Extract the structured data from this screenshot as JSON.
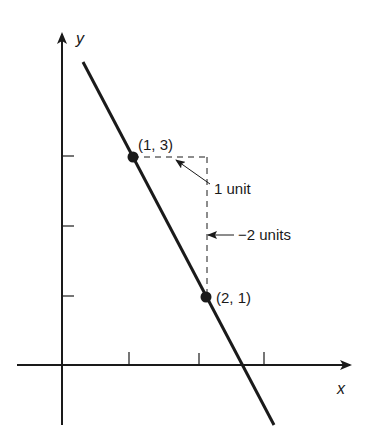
{
  "diagram": {
    "type": "slope-illustration",
    "axes": {
      "x_label": "x",
      "y_label": "y"
    },
    "points": [
      {
        "label": "(1, 3)",
        "x": 1,
        "y": 3
      },
      {
        "label": "(2, 1)",
        "x": 2,
        "y": 1
      }
    ],
    "annotations": {
      "run": "1 unit",
      "rise": "−2 units"
    },
    "x_ticks": [
      1,
      2,
      3
    ],
    "y_ticks": [
      1,
      2,
      3
    ],
    "colors": {
      "ink": "#1a1a1a",
      "background": "#ffffff"
    }
  }
}
